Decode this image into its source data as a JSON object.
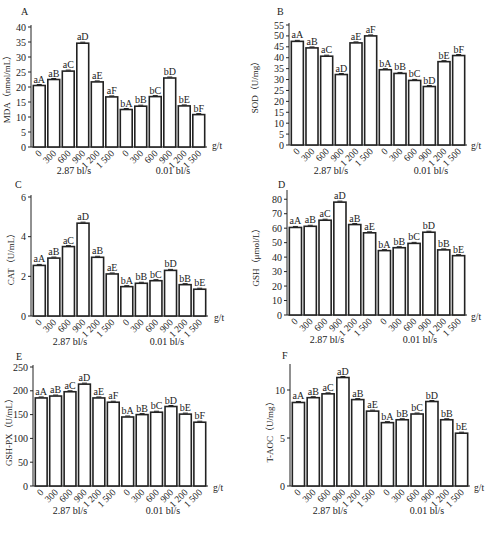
{
  "figure": {
    "x_categories": [
      "0",
      "300",
      "600",
      "900",
      "1 200",
      "1 500",
      "0",
      "300",
      "600",
      "900",
      "1 200",
      "1 500"
    ],
    "x_unit": "g/t",
    "group_labels": [
      "2.87 bl/s",
      "0.01 bl/s"
    ]
  },
  "chart_data": [
    {
      "panel": "A",
      "type": "bar",
      "ylabel": "MDA（nmol/mL）",
      "xlabel": "g/t",
      "ylim": [
        0,
        40
      ],
      "yticks": [
        0,
        5,
        10,
        15,
        20,
        25,
        30,
        35,
        40
      ],
      "categories": [
        "0",
        "300",
        "600",
        "900",
        "1 200",
        "1 500",
        "0",
        "300",
        "600",
        "900",
        "1 200",
        "1 500"
      ],
      "groups": [
        "2.87 bl/s",
        "0.01 bl/s"
      ],
      "values": [
        20.5,
        22.5,
        25.3,
        34.6,
        21.7,
        16.7,
        12.5,
        13.6,
        16.8,
        23.0,
        13.7,
        10.8
      ],
      "labels": [
        "aA",
        "aB",
        "aC",
        "aD",
        "aE",
        "aF",
        "bA",
        "bB",
        "bC",
        "bD",
        "bE",
        "bF"
      ]
    },
    {
      "panel": "B",
      "type": "bar",
      "ylabel": "SOD（U/mg）",
      "xlabel": "g/t",
      "ylim": [
        0,
        55
      ],
      "yticks": [
        0,
        5,
        10,
        15,
        20,
        25,
        30,
        35,
        40,
        45,
        50,
        55
      ],
      "categories": [
        "0",
        "300",
        "600",
        "900",
        "1 200",
        "1 500",
        "0",
        "300",
        "600",
        "900",
        "1 200",
        "1 500"
      ],
      "groups": [
        "2.87 bl/s",
        "0.01 bl/s"
      ],
      "values": [
        47.5,
        44.5,
        40.7,
        32.3,
        46.8,
        50.0,
        34.5,
        32.8,
        29.6,
        26.8,
        38.2,
        41.0
      ],
      "labels": [
        "aA",
        "aB",
        "aC",
        "aD",
        "aE",
        "aF",
        "bA",
        "bB",
        "bC",
        "bD",
        "bE",
        "bF"
      ]
    },
    {
      "panel": "C",
      "type": "bar",
      "ylabel": "CAT（U/mL）",
      "xlabel": "g/t",
      "ylim": [
        0,
        6
      ],
      "yticks": [
        0,
        2,
        4,
        6
      ],
      "categories": [
        "0",
        "300",
        "600",
        "900",
        "1 200",
        "1 500",
        "0",
        "300",
        "600",
        "900",
        "1 200",
        "1 500"
      ],
      "groups": [
        "2.87 bl/s",
        "0.01 bl/s"
      ],
      "values": [
        2.55,
        2.92,
        3.5,
        4.68,
        2.96,
        2.12,
        1.48,
        1.65,
        1.78,
        2.3,
        1.58,
        1.35
      ],
      "labels": [
        "aA",
        "aB",
        "aC",
        "aD",
        "aB",
        "aE",
        "bA",
        "bB",
        "bC",
        "bD",
        "bB",
        "bE"
      ]
    },
    {
      "panel": "D",
      "type": "bar",
      "ylabel": "GSH（μmol/L）",
      "xlabel": "g/t",
      "ylim": [
        0,
        85
      ],
      "yticks": [
        0,
        10,
        20,
        30,
        40,
        50,
        60,
        70,
        80
      ],
      "categories": [
        "0",
        "300",
        "600",
        "900",
        "1 200",
        "1 500",
        "0",
        "300",
        "600",
        "900",
        "1 200",
        "1 500"
      ],
      "groups": [
        "2.87 bl/s",
        "0.01 bl/s"
      ],
      "values": [
        60.5,
        61.3,
        65.5,
        78.0,
        62.5,
        56.8,
        44.5,
        46.5,
        49.5,
        57.2,
        45.0,
        41.0
      ],
      "labels": [
        "aA",
        "aB",
        "aC",
        "aD",
        "aB",
        "aE",
        "bA",
        "bB",
        "bC",
        "bD",
        "bB",
        "bE"
      ]
    },
    {
      "panel": "E",
      "type": "bar",
      "ylabel": "GSH-PX（U/mL）",
      "xlabel": "g/t",
      "ylim": [
        0,
        250
      ],
      "yticks": [
        0,
        50,
        100,
        150,
        200,
        250
      ],
      "categories": [
        "0",
        "300",
        "600",
        "900",
        "1 200",
        "1 500",
        "0",
        "300",
        "600",
        "900",
        "1 200",
        "1 500"
      ],
      "groups": [
        "2.87 bl/s",
        "0.01 bl/s"
      ],
      "values": [
        185,
        189,
        198,
        214,
        185,
        176,
        145,
        150,
        155,
        167,
        151,
        134
      ],
      "labels": [
        "aA",
        "aB",
        "aC",
        "aD",
        "aE",
        "aF",
        "bA",
        "bB",
        "bC",
        "bD",
        "bE",
        "bF"
      ]
    },
    {
      "panel": "F",
      "type": "bar",
      "ylabel": "T-AOC（U/mg）",
      "xlabel": "g/t",
      "ylim": [
        0,
        12.5
      ],
      "yticks": [
        0,
        5,
        10
      ],
      "categories": [
        "0",
        "300",
        "600",
        "900",
        "1 200",
        "1 500",
        "0",
        "300",
        "600",
        "900",
        "1 200",
        "1 500"
      ],
      "groups": [
        "2.87 bl/s",
        "0.01 bl/s"
      ],
      "values": [
        8.7,
        9.2,
        9.6,
        11.3,
        9.0,
        7.8,
        6.6,
        6.9,
        7.5,
        8.8,
        6.9,
        5.5
      ],
      "labels": [
        "aA",
        "aB",
        "aC",
        "aD",
        "aB",
        "aE",
        "bA",
        "bB",
        "bC",
        "bD",
        "bB",
        "bE"
      ]
    }
  ]
}
